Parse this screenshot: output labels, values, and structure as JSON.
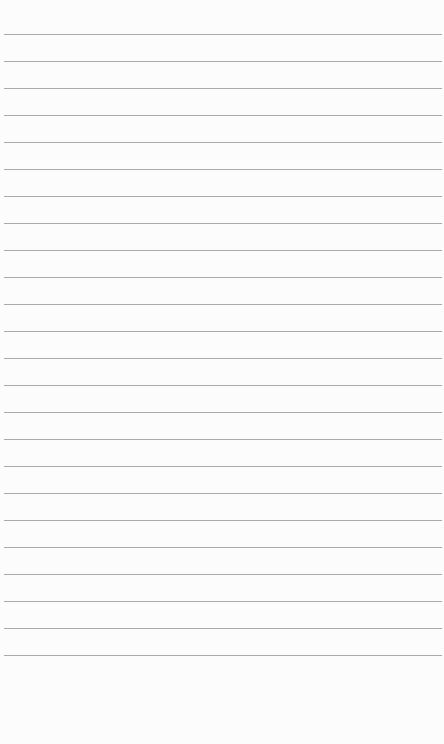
{
  "page": {
    "type": "lined-paper",
    "background_color": "#fcfcfc",
    "rule_color": "#9a9a9a",
    "rule_count": 24,
    "first_rule_y": 34,
    "rule_spacing": 27.0
  }
}
